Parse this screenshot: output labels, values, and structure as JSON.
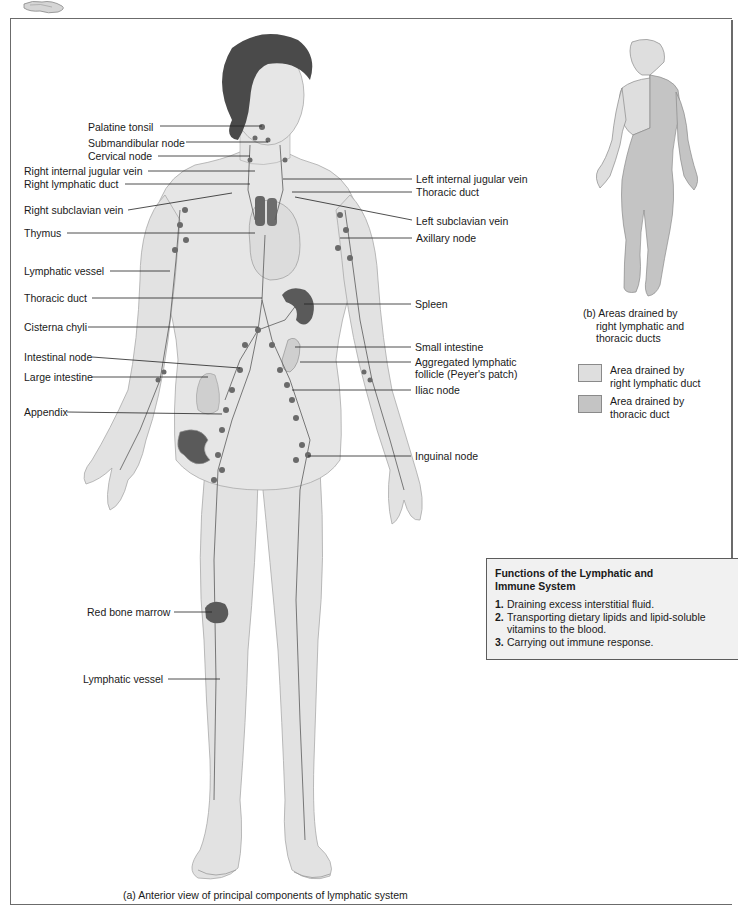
{
  "figure": {
    "panel_a_caption": "(a) Anterior view of principal components of lymphatic system",
    "panel_b_caption_lines": [
      "(b) Areas drained by",
      "right lymphatic and",
      "thoracic ducts"
    ],
    "colors": {
      "skin": "#e4e4e4",
      "skin_shadow": "#c9c9c9",
      "hair": "#4a4a4a",
      "node": "#6a6a6a",
      "vessel": "#555555",
      "organ_dark": "#5e5e5e",
      "right_duct_area": "#dedede",
      "thoracic_duct_area": "#c4c4c4",
      "border": "#6b6b6b",
      "box_bg": "#f1f1f1"
    }
  },
  "labels_left": [
    {
      "text": "Palatine tonsil",
      "x": 88,
      "y": 121
    },
    {
      "text": "Submandibular node",
      "x": 88,
      "y": 138
    },
    {
      "text": "Cervical node",
      "x": 88,
      "y": 151
    },
    {
      "text": "Right internal jugular vein",
      "x": 24,
      "y": 166
    },
    {
      "text": "Right lymphatic duct",
      "x": 24,
      "y": 179
    },
    {
      "text": "Right subclavian vein",
      "x": 24,
      "y": 205
    },
    {
      "text": "Thymus",
      "x": 24,
      "y": 228
    },
    {
      "text": "Lymphatic vessel",
      "x": 24,
      "y": 266
    },
    {
      "text": "Thoracic duct",
      "x": 24,
      "y": 293
    },
    {
      "text": "Cisterna chyli",
      "x": 24,
      "y": 322
    },
    {
      "text": "Intestinal node",
      "x": 24,
      "y": 352
    },
    {
      "text": "Large intestine",
      "x": 24,
      "y": 372
    },
    {
      "text": "Appendix",
      "x": 24,
      "y": 407
    },
    {
      "text": "Red bone marrow",
      "x": 87,
      "y": 607
    },
    {
      "text": "Lymphatic vessel",
      "x": 83,
      "y": 674
    }
  ],
  "labels_right": [
    {
      "text": "Left internal jugular vein",
      "x": 416,
      "y": 174
    },
    {
      "text": "Thoracic duct",
      "x": 416,
      "y": 187
    },
    {
      "text": "Left subclavian vein",
      "x": 416,
      "y": 216
    },
    {
      "text": "Axillary node",
      "x": 416,
      "y": 233
    },
    {
      "text": "Spleen",
      "x": 415,
      "y": 299
    },
    {
      "text": "Small intestine",
      "x": 415,
      "y": 342
    },
    {
      "text": "Aggregated lymphatic",
      "x": 415,
      "y": 357
    },
    {
      "text": "follicle (Peyer's patch)",
      "x": 415,
      "y": 369
    },
    {
      "text": "Iliac node",
      "x": 415,
      "y": 385
    },
    {
      "text": "Inguinal node",
      "x": 415,
      "y": 451
    }
  ],
  "legend": [
    {
      "label_lines": [
        "Area drained by",
        "right lymphatic duct"
      ],
      "swatch": "#dedede"
    },
    {
      "label_lines": [
        "Area drained by",
        "thoracic duct"
      ],
      "swatch": "#c4c4c4"
    }
  ],
  "functions_box": {
    "title_lines": [
      "Functions of the Lymphatic and",
      "Immune System"
    ],
    "items": [
      {
        "num": "1.",
        "lines": [
          "Draining excess interstitial fluid."
        ]
      },
      {
        "num": "2.",
        "lines": [
          "Transporting dietary lipids and lipid-soluble",
          "vitamins to the blood."
        ]
      },
      {
        "num": "3.",
        "lines": [
          "Carrying out immune response."
        ]
      }
    ]
  }
}
